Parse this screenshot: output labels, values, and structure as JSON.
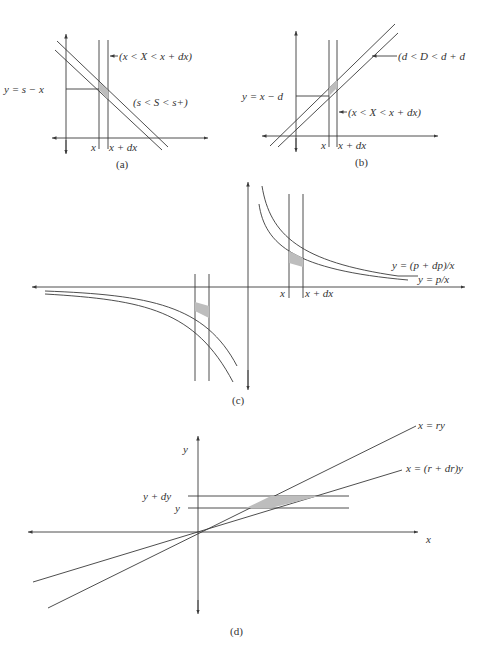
{
  "panels": {
    "a": {
      "caption": "(a)",
      "label_line": "y = s − x",
      "label_strip": "(x < X < x + dx)",
      "label_band": "(s < S < s+)",
      "tick_x": "x",
      "tick_xdx": "x + dx"
    },
    "b": {
      "caption": "(b)",
      "label_line": "y = x − d",
      "label_band": "(d < D < d + d",
      "label_strip": "(x < X < x + dx)",
      "tick_x": "x",
      "tick_xdx": "x + dx"
    },
    "c": {
      "caption": "(c)",
      "label_outer": "y = (p + dp)/x",
      "label_inner": "y = p/x",
      "tick_x": "x",
      "tick_xdx": "x + dx"
    },
    "d": {
      "caption": "(d)",
      "label_line1": "x = ry",
      "label_line2": "x = (r + dr)y",
      "label_ydy": "y + dy",
      "label_y": "y",
      "axis_y": "y",
      "axis_x": "x"
    }
  },
  "colors": {
    "line": "#3a3a3a",
    "shade": "#bdbdbd",
    "background": "#ffffff"
  }
}
